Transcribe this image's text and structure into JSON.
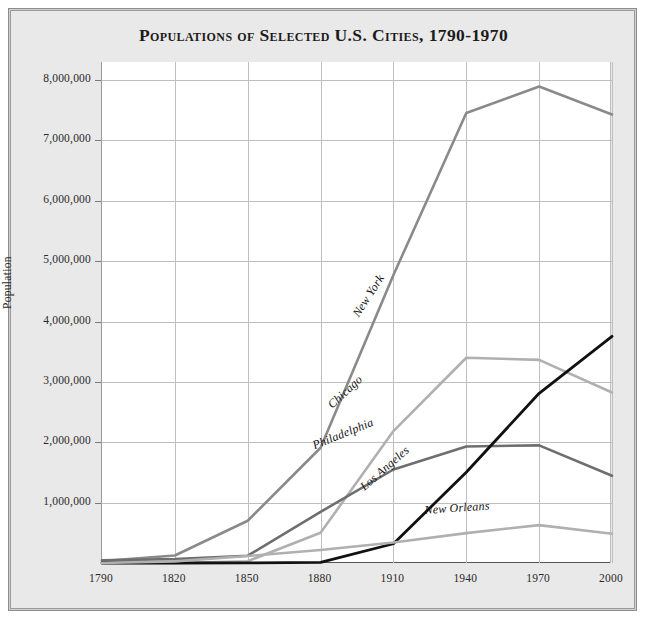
{
  "figure": {
    "background_color": "#e9e9e9",
    "plot_background_color": "#ffffff",
    "border_color": "#8d8d8d"
  },
  "title": "Populations of Selected U.S. Cities, 1790-1970",
  "chart_data": {
    "type": "line",
    "title": "Populations of Selected U.S. Cities, 1790-1970",
    "xlabel": "",
    "ylabel": "Population",
    "x": [
      1790,
      1820,
      1850,
      1880,
      1910,
      1940,
      1970,
      2000
    ],
    "xtick_labels": [
      "1790",
      "1820",
      "1850",
      "1880",
      "1910",
      "1940",
      "1970",
      "2000"
    ],
    "ytick_labels": [
      "1,000,000",
      "2,000,000",
      "3,000,000",
      "4,000,000",
      "5,000,000",
      "6,000,000",
      "7,000,000",
      "8,000,000"
    ],
    "ytick_values": [
      1000000,
      2000000,
      3000000,
      4000000,
      5000000,
      6000000,
      7000000,
      8000000
    ],
    "xlim": [
      1790,
      2000
    ],
    "ylim": [
      0,
      8300000
    ],
    "grid": true,
    "legend": "inline-labels",
    "series": [
      {
        "name": "New York",
        "color": "#8a8a8a",
        "width": 2.6,
        "label_x": 1897,
        "label_y": 4050000,
        "label_rotation": -57,
        "values": [
          33000,
          124000,
          700000,
          1910000,
          4770000,
          7455000,
          7895000,
          7430000
        ]
      },
      {
        "name": "Chicago",
        "color": "#b0b0b0",
        "width": 2.6,
        "label_x": 1886,
        "label_y": 2520000,
        "label_rotation": -43,
        "values": [
          0,
          0,
          30000,
          500000,
          2185000,
          3400000,
          3365000,
          2825000
        ]
      },
      {
        "name": "Philadelphia",
        "color": "#6e6e6e",
        "width": 2.6,
        "label_x": 1878,
        "label_y": 1840000,
        "label_rotation": -22,
        "values": [
          44000,
          64000,
          121000,
          847000,
          1549000,
          1931000,
          1949000,
          1445000
        ]
      },
      {
        "name": "Los Angeles",
        "color": "#111111",
        "width": 2.8,
        "label_x": 1899,
        "label_y": 1160000,
        "label_rotation": -41,
        "values": [
          0,
          0,
          1610,
          11000,
          319000,
          1504000,
          2811000,
          3755000
        ]
      },
      {
        "name": "New Orleans",
        "color": "#b0b0b0",
        "width": 2.6,
        "label_x": 1923,
        "label_y": 760000,
        "label_rotation": -4,
        "values": [
          0,
          27000,
          116000,
          216000,
          339000,
          495000,
          628000,
          485000
        ]
      }
    ]
  }
}
